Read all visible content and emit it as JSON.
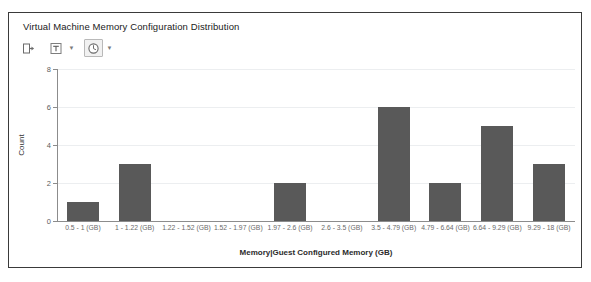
{
  "panel": {
    "title": "Virtual Machine Memory Configuration Distribution",
    "border_color": "#3a3a3a",
    "background": "#ffffff"
  },
  "toolbar": {
    "items": [
      {
        "name": "export-icon",
        "label": "Export",
        "has_chevron": false,
        "framed": false
      },
      {
        "name": "text-format-icon",
        "label": "Text Options",
        "has_chevron": true,
        "framed": false
      },
      {
        "name": "clock-icon",
        "label": "Time Range",
        "has_chevron": true,
        "framed": true
      }
    ],
    "chevron_glyph": "▼"
  },
  "chart_data": {
    "type": "bar",
    "title": "Virtual Machine Memory Configuration Distribution",
    "xlabel": "Memory|Guest Configured Memory (GB)",
    "ylabel": "Count",
    "ylim": [
      0,
      8
    ],
    "yticks": [
      0,
      2,
      4,
      6,
      8
    ],
    "grid": true,
    "legend": "none",
    "bar_color": "#595959",
    "categories": [
      "0.5 - 1 (GB)",
      "1 - 1.22 (GB)",
      "1.22 - 1.52 (GB)",
      "1.52 - 1.97 (GB)",
      "1.97 - 2.6 (GB)",
      "2.6 - 3.5 (GB)",
      "3.5 - 4.79 (GB)",
      "4.79 - 6.64 (GB)",
      "6.64 - 9.29 (GB)",
      "9.29 - 18 (GB)"
    ],
    "values": [
      1,
      3,
      0,
      0,
      2,
      0,
      6,
      2,
      5,
      3
    ]
  }
}
